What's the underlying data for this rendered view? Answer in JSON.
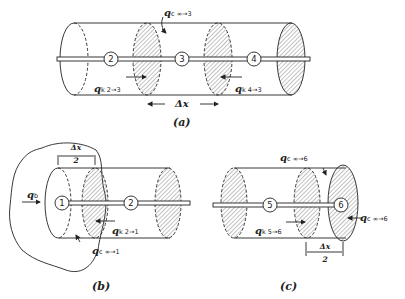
{
  "figure": {
    "panels": [
      {
        "id": "a",
        "caption": "(a)",
        "nodes": [
          "2",
          "3",
          "4"
        ],
        "labels": {
          "convection": {
            "symbol": "q",
            "subscript": "c ∞→3"
          },
          "conduction_left": {
            "symbol": "q",
            "subscript": "k 2→3"
          },
          "conduction_right": {
            "symbol": "q",
            "subscript": "k 4→3"
          },
          "spacing": "Δx"
        }
      },
      {
        "id": "b",
        "caption": "(b)",
        "nodes": [
          "1",
          "2"
        ],
        "labels": {
          "base": {
            "symbol": "q",
            "subscript": "b"
          },
          "conduction": {
            "symbol": "q",
            "subscript": "k 2→1"
          },
          "convection": {
            "symbol": "q",
            "subscript": "c ∞→1"
          },
          "spacing_num": "Δx",
          "spacing_den": "2"
        }
      },
      {
        "id": "c",
        "caption": "(c)",
        "nodes": [
          "5",
          "6"
        ],
        "labels": {
          "convection_side": {
            "symbol": "q",
            "subscript": "c ∞→6"
          },
          "convection_end": {
            "symbol": "q",
            "subscript": "c ∞→6"
          },
          "conduction": {
            "symbol": "q",
            "subscript": "k 5→6"
          },
          "spacing_num": "Δx",
          "spacing_den": "2"
        }
      }
    ],
    "colors": {
      "ink": "#222222",
      "hatch": "#555555",
      "background": "#ffffff"
    }
  }
}
